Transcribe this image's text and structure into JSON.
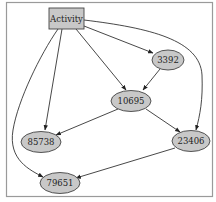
{
  "diagram": {
    "type": "directed-graph",
    "frame": {
      "border_color": "#9a9a9a",
      "background": "#ffffff"
    },
    "colors": {
      "node_fill": "#c8c8c8",
      "node_stroke": "#444444",
      "edge_color": "#333333",
      "label_color": "#222222"
    },
    "nodes": [
      {
        "id": "activity",
        "label": "Activity",
        "shape": "box"
      },
      {
        "id": "n3392",
        "label": "3392",
        "shape": "ellipse"
      },
      {
        "id": "n10695",
        "label": "10695",
        "shape": "ellipse"
      },
      {
        "id": "n85738",
        "label": "85738",
        "shape": "ellipse"
      },
      {
        "id": "n23406",
        "label": "23406",
        "shape": "ellipse"
      },
      {
        "id": "n79651",
        "label": "79651",
        "shape": "ellipse"
      }
    ],
    "edges": [
      {
        "from": "Activity",
        "to": "3392"
      },
      {
        "from": "Activity",
        "to": "10695"
      },
      {
        "from": "Activity",
        "to": "85738"
      },
      {
        "from": "Activity",
        "to": "23406"
      },
      {
        "from": "Activity",
        "to": "79651"
      },
      {
        "from": "3392",
        "to": "10695"
      },
      {
        "from": "10695",
        "to": "85738"
      },
      {
        "from": "10695",
        "to": "23406"
      },
      {
        "from": "23406",
        "to": "79651"
      }
    ]
  }
}
